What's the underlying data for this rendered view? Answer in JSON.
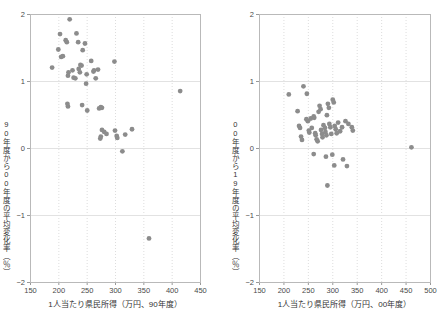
{
  "figure": {
    "dot_color": "#8c8c8c",
    "frame_color": "#b9b9b9",
    "grid_color": "#dddddd"
  },
  "chart_data": [
    {
      "type": "scatter",
      "panel": "left",
      "title": "",
      "xlabel": "1人当たり県民所得（万円、90年度）",
      "ylabel": "90年度から00年度の平均変化率（％）",
      "xlim": [
        150,
        450
      ],
      "ylim": [
        -2,
        2
      ],
      "xticks": [
        150,
        200,
        250,
        300,
        350,
        400,
        450
      ],
      "yticks": [
        2,
        1,
        0,
        -1,
        -2
      ],
      "grid": "both",
      "legend": "none",
      "points": [
        [
          189,
          1.2
        ],
        [
          203,
          1.7
        ],
        [
          200,
          1.47
        ],
        [
          205,
          1.36
        ],
        [
          208,
          1.37
        ],
        [
          213,
          1.61
        ],
        [
          215,
          1.58
        ],
        [
          220,
          1.92
        ],
        [
          218,
          1.13
        ],
        [
          217,
          1.08
        ],
        [
          216,
          0.66
        ],
        [
          217,
          0.62
        ],
        [
          225,
          1.16
        ],
        [
          227,
          1.05
        ],
        [
          230,
          1.04
        ],
        [
          232,
          1.71
        ],
        [
          235,
          1.58
        ],
        [
          236,
          1.18
        ],
        [
          238,
          1.13
        ],
        [
          239,
          1.24
        ],
        [
          241,
          1.23
        ],
        [
          243,
          1.46
        ],
        [
          242,
          0.64
        ],
        [
          247,
          1.56
        ],
        [
          249,
          0.96
        ],
        [
          250,
          1.1
        ],
        [
          251,
          0.56
        ],
        [
          258,
          1.3
        ],
        [
          262,
          1.14
        ],
        [
          263,
          1.16
        ],
        [
          266,
          1.04
        ],
        [
          270,
          1.17
        ],
        [
          272,
          0.59
        ],
        [
          275,
          0.61
        ],
        [
          277,
          0.6
        ],
        [
          274,
          0.14
        ],
        [
          275,
          0.17
        ],
        [
          277,
          0.27
        ],
        [
          281,
          0.24
        ],
        [
          285,
          0.21
        ],
        [
          299,
          1.29
        ],
        [
          300,
          0.26
        ],
        [
          303,
          0.18
        ],
        [
          304,
          0.15
        ],
        [
          313,
          -0.05
        ],
        [
          318,
          0.2
        ],
        [
          330,
          0.28
        ],
        [
          360,
          -1.35
        ],
        [
          415,
          0.85
        ]
      ]
    },
    {
      "type": "scatter",
      "panel": "right",
      "title": "",
      "xlabel": "1人当たり県民所得（万円、00年度）",
      "ylabel": "00年度から19年度の平均変化率（％）",
      "xlim": [
        150,
        500
      ],
      "ylim": [
        -2,
        2
      ],
      "xticks": [
        150,
        200,
        250,
        300,
        350,
        400,
        450,
        500
      ],
      "yticks": [
        2,
        1,
        0,
        -1,
        -2
      ],
      "grid": "both",
      "legend": "none",
      "points": [
        [
          211,
          0.8
        ],
        [
          229,
          0.55
        ],
        [
          232,
          0.33
        ],
        [
          234,
          0.3
        ],
        [
          236,
          0.17
        ],
        [
          238,
          0.12
        ],
        [
          241,
          0.92
        ],
        [
          248,
          0.81
        ],
        [
          247,
          0.43
        ],
        [
          250,
          0.4
        ],
        [
          252,
          0.26
        ],
        [
          253,
          0.23
        ],
        [
          256,
          0.44
        ],
        [
          258,
          0.3
        ],
        [
          262,
          0.47
        ],
        [
          263,
          0.45
        ],
        [
          265,
          0.22
        ],
        [
          266,
          0.19
        ],
        [
          268,
          0.13
        ],
        [
          270,
          0.1
        ],
        [
          272,
          0.54
        ],
        [
          274,
          0.63
        ],
        [
          276,
          0.58
        ],
        [
          277,
          0.27
        ],
        [
          279,
          0.21
        ],
        [
          280,
          0.16
        ],
        [
          282,
          0.34
        ],
        [
          285,
          0.3
        ],
        [
          286,
          0.24
        ],
        [
          288,
          0.19
        ],
        [
          289,
          0.49
        ],
        [
          291,
          0.66
        ],
        [
          293,
          0.6
        ],
        [
          294,
          0.36
        ],
        [
          296,
          0.31
        ],
        [
          298,
          0.21
        ],
        [
          301,
          0.72
        ],
        [
          303,
          0.68
        ],
        [
          305,
          0.33
        ],
        [
          307,
          0.28
        ],
        [
          309,
          0.22
        ],
        [
          312,
          0.38
        ],
        [
          316,
          0.25
        ],
        [
          320,
          0.31
        ],
        [
          327,
          0.4
        ],
        [
          333,
          0.36
        ],
        [
          340,
          0.31
        ],
        [
          342,
          0.26
        ],
        [
          262,
          -0.09
        ],
        [
          287,
          -0.13
        ],
        [
          290,
          -0.56
        ],
        [
          300,
          -0.1
        ],
        [
          304,
          -0.26
        ],
        [
          322,
          -0.17
        ],
        [
          330,
          -0.27
        ],
        [
          462,
          0.01
        ]
      ]
    }
  ]
}
